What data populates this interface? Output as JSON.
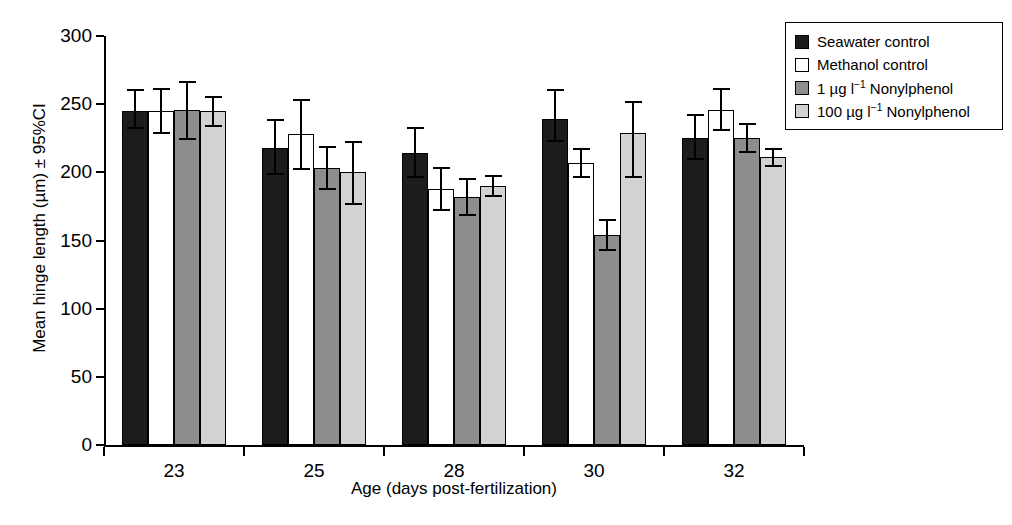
{
  "chart_data": {
    "type": "bar",
    "title": "",
    "xlabel": "Age (days post-fertilization)",
    "ylabel": "Mean hinge length (µm) ± 95%CI",
    "categories": [
      "23",
      "25",
      "28",
      "30",
      "32"
    ],
    "ylim": [
      0,
      300
    ],
    "yticks": [
      0,
      50,
      100,
      150,
      200,
      250,
      300
    ],
    "ytick_labels": [
      "0",
      "50",
      "100",
      "150",
      "200",
      "250",
      "300"
    ],
    "grid": false,
    "legend_position": "top-right",
    "error_type": "95% CI",
    "series": [
      {
        "name": "Seawater control",
        "color": "#1c1c1c",
        "values": [
          245,
          218,
          214,
          239,
          225
        ],
        "err_low": [
          13,
          20,
          18,
          17,
          16
        ],
        "err_high": [
          16,
          21,
          19,
          22,
          18
        ]
      },
      {
        "name": "Methanol control",
        "color": "#ffffff",
        "values": [
          245,
          228,
          188,
          207,
          246
        ],
        "err_low": [
          17,
          26,
          16,
          11,
          16
        ],
        "err_high": [
          17,
          26,
          16,
          11,
          16
        ]
      },
      {
        "name": "1 µg l⁻¹ Nonylphenol",
        "color": "#8d8d8d",
        "values": [
          246,
          203,
          182,
          154,
          225
        ],
        "err_low": [
          22,
          16,
          14,
          12,
          11
        ],
        "err_high": [
          21,
          16,
          14,
          12,
          11
        ]
      },
      {
        "name": "100 µg l⁻¹ Nonylphenol",
        "color": "#d2d2d2",
        "values": [
          245,
          200,
          190,
          229,
          211
        ],
        "err_low": [
          12,
          24,
          8,
          33,
          7
        ],
        "err_high": [
          11,
          23,
          8,
          23,
          7
        ]
      }
    ]
  },
  "legend": {
    "items": [
      {
        "label_html": "Seawater control",
        "swatch": "s0"
      },
      {
        "label_html": "Methanol control",
        "swatch": "s1"
      },
      {
        "label_html": "1 &#181;g l<sup>&#8722;1</sup> Nonylphenol",
        "swatch": "s2"
      },
      {
        "label_html": "100 &#181;g l<sup>&#8722;1</sup> Nonylphenol",
        "swatch": "s3"
      }
    ]
  },
  "axes": {
    "y_title": "Mean hinge length (µm) ± 95%CI",
    "x_title": "Age (days post-fertilization)"
  }
}
